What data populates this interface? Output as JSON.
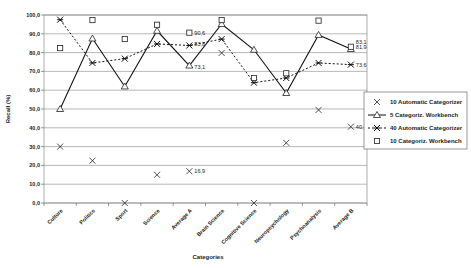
{
  "chart_data": {
    "type": "line",
    "title": "",
    "xlabel": "Categories",
    "ylabel": "Recall (%)",
    "ylim": [
      0,
      100
    ],
    "yticks": [
      "0,0",
      "10,0",
      "20,0",
      "30,0",
      "40,0",
      "50,0",
      "60,0",
      "70,0",
      "80,0",
      "90,0",
      "100,0"
    ],
    "grid": true,
    "legend_position": "right",
    "categories": [
      "Culture",
      "Politics",
      "Sport",
      "Science",
      "Average A",
      "Brain Science",
      "Cognitive Science",
      "Neuropsychology",
      "Psychoanalysis",
      "Average B"
    ],
    "series": [
      {
        "name": "10 Automatic Categorizer",
        "marker": "x",
        "line": "none",
        "values": [
          30.0,
          22.5,
          0.0,
          15.0,
          16.9,
          79.8,
          0.0,
          32.0,
          49.5,
          40.6
        ]
      },
      {
        "name": "5 Categoriz. Workbench",
        "marker": "triangle",
        "line": "solid",
        "values": [
          50.0,
          87.5,
          62.0,
          91.6,
          73.1,
          95.2,
          81.5,
          58.5,
          89.4,
          81.9
        ]
      },
      {
        "name": "40 Automatic Categorizer",
        "marker": "asterisk",
        "line": "dashed",
        "values": [
          97.5,
          74.5,
          76.8,
          84.6,
          83.8,
          87.2,
          64.0,
          66.5,
          74.5,
          73.6
        ]
      },
      {
        "name": "10 Categoriz. Workbench",
        "marker": "square",
        "line": "none",
        "values": [
          82.4,
          97.3,
          87.2,
          94.8,
          90.6,
          97.3,
          66.5,
          69.0,
          97.0,
          83.1
        ]
      }
    ],
    "annotations": [
      {
        "series": 0,
        "category": "Average A",
        "text": "16,9"
      },
      {
        "series": 0,
        "category": "Average B",
        "text": "40,6"
      },
      {
        "series": 1,
        "category": "Average A",
        "text": "73,1"
      },
      {
        "series": 1,
        "category": "Average B",
        "text": "81,9"
      },
      {
        "series": 2,
        "category": "Average A",
        "text": "83,8"
      },
      {
        "series": 2,
        "category": "Average B",
        "text": "73,6"
      },
      {
        "series": 3,
        "category": "Average A",
        "text": "90,6"
      },
      {
        "series": 3,
        "category": "Average B",
        "text": "83,1"
      }
    ]
  }
}
